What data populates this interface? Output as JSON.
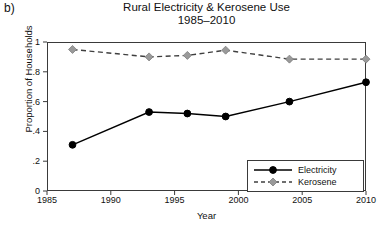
{
  "panel": {
    "label": "b)"
  },
  "chart_data": {
    "type": "line",
    "title": "Rural Electricity & Kerosene Use",
    "subtitle": "1985–2010",
    "xlabel": "Year",
    "ylabel": "Proportion of Households",
    "xlim": [
      1985,
      2010
    ],
    "ylim": [
      0,
      1
    ],
    "grid": false,
    "legend_position": "bottom-right",
    "xticks": [
      1985,
      1990,
      1995,
      2000,
      2005,
      2010
    ],
    "xticklabels": [
      "1985",
      "1990",
      "1995",
      "2000",
      "2005",
      "2010"
    ],
    "yticks": [
      0,
      0.2,
      0.4,
      0.6,
      0.8,
      1
    ],
    "yticklabels": [
      "0",
      ".2",
      ".4",
      ".6",
      ".8",
      "1"
    ],
    "series": [
      {
        "name": "Electricity",
        "color": "#000000",
        "linestyle": "solid",
        "marker": "circle",
        "marker_color": "#000000",
        "x": [
          1987,
          1993,
          1996,
          1999,
          2004,
          2010
        ],
        "values": [
          0.31,
          0.53,
          0.52,
          0.5,
          0.6,
          0.73
        ]
      },
      {
        "name": "Kerosene",
        "color": "#3f3f3f",
        "linestyle": "dashed",
        "marker": "diamond",
        "marker_color": "#9a9a9a",
        "x": [
          1987,
          1993,
          1996,
          1999,
          2004,
          2010
        ],
        "values": [
          0.95,
          0.9,
          0.91,
          0.945,
          0.885,
          0.885
        ]
      }
    ]
  },
  "legend": {
    "items": [
      {
        "label": "Electricity"
      },
      {
        "label": "Kerosene"
      }
    ]
  }
}
